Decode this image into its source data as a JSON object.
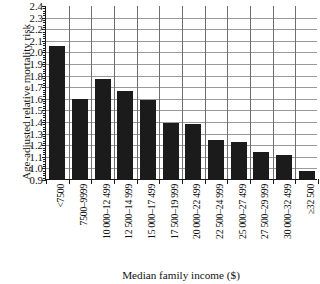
{
  "chart_data": {
    "type": "bar",
    "title": "",
    "xlabel": "Median family income ($)",
    "ylabel": "Age-adjusted relative mortality risk",
    "ylim": [
      0.9,
      2.4
    ],
    "ytick_step": 0.1,
    "yticks": [
      "0.9",
      "1.0",
      "1.1",
      "1.2",
      "1.3",
      "1.4",
      "1.5",
      "1.6",
      "1.7",
      "1.8",
      "1.9",
      "2.0",
      "2.1",
      "2.2",
      "2.3",
      "2.4"
    ],
    "grid": "both",
    "legend": "none",
    "bar_color": "#1b1b1b",
    "categories": [
      "<7500",
      "7500–9999",
      "10 000–12 499",
      "12 500–14 999",
      "15 000–17 499",
      "17 500–19 999",
      "20 000–22 499",
      "22 500–24 999",
      "25 000–27 499",
      "27 500–29 999",
      "30 000–32 499",
      "≥32 500"
    ],
    "values": [
      2.05,
      1.59,
      1.76,
      1.66,
      1.58,
      1.38,
      1.37,
      1.24,
      1.22,
      1.13,
      1.11,
      0.97
    ]
  }
}
